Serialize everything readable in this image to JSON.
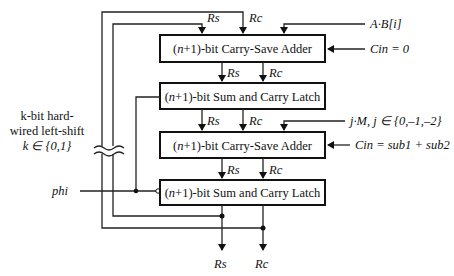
{
  "blocks": [
    {
      "id": "csa1",
      "pre": "(",
      "n": "n",
      "post": "+1)-bit Carry-Save Adder"
    },
    {
      "id": "latch1",
      "pre": "(",
      "n": "n",
      "post": "+1)-bit Sum and Carry Latch"
    },
    {
      "id": "csa2",
      "pre": "(",
      "n": "n",
      "post": "+1)-bit Carry-Save Adder"
    },
    {
      "id": "latch2",
      "pre": "(",
      "n": "n",
      "post": "+1)-bit Sum and Carry Latch"
    }
  ],
  "signals": {
    "rs": "Rs",
    "rc": "Rc",
    "input_ab": "A·B[i]",
    "cin1": "Cin = 0",
    "input_jm": "j·M, j ∈ {0,–1,–2}",
    "cin2": "Cin = sub1 + sub2",
    "phi": "phi"
  },
  "shift_note": {
    "line1": "k-bit hard-",
    "line2": "wired left-shift",
    "line3": "k ∈ {0,1}"
  }
}
